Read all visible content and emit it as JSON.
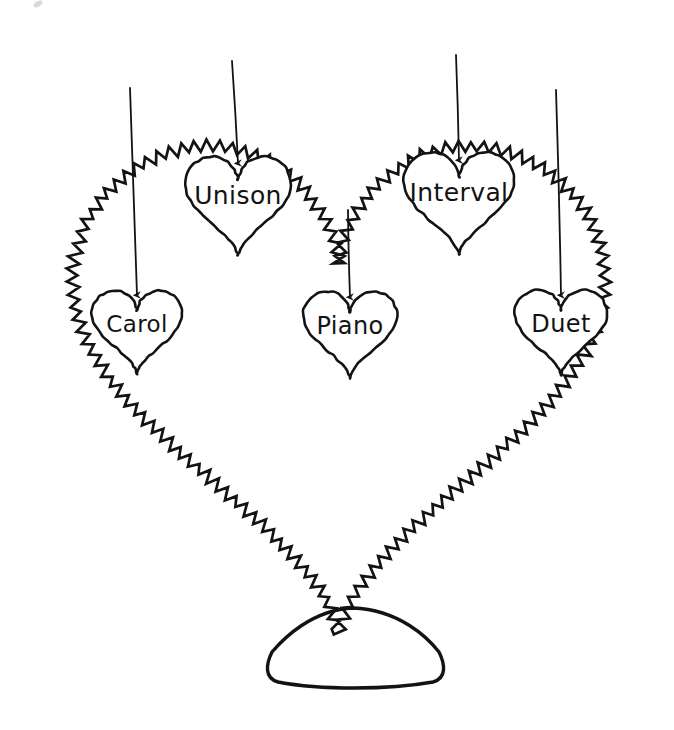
{
  "figure": {
    "type": "hand-drawn-concept-diagram",
    "background_color": "#ffffff",
    "ink_color": "#131313",
    "outer_shape": "heart",
    "outer_shape_stroke_style": "zigzag-sawtooth",
    "base_shape": "rounded-dome-pedestal",
    "arrow_count": 5,
    "inner_shape": "heart"
  },
  "nodes": [
    {
      "id": "carol",
      "label": "Carol",
      "cx": 137,
      "cy": 323,
      "w": 96,
      "h": 98,
      "font_size": 23,
      "arrow": {
        "x1": 130,
        "y1": 88,
        "x2": 137,
        "y2": 295
      }
    },
    {
      "id": "unison",
      "label": "Unison",
      "cx": 238,
      "cy": 195,
      "w": 112,
      "h": 116,
      "font_size": 25,
      "arrow": {
        "x1": 232,
        "y1": 61,
        "x2": 238,
        "y2": 163
      }
    },
    {
      "id": "piano",
      "label": "Piano",
      "cx": 350,
      "cy": 325,
      "w": 100,
      "h": 102,
      "font_size": 24,
      "arrow": {
        "x1": 348,
        "y1": 210,
        "x2": 350,
        "y2": 297
      }
    },
    {
      "id": "interval",
      "label": "Interval",
      "cx": 459,
      "cy": 192,
      "w": 118,
      "h": 120,
      "font_size": 25,
      "arrow": {
        "x1": 456,
        "y1": 55,
        "x2": 459,
        "y2": 160
      }
    },
    {
      "id": "duet",
      "label": "Duet",
      "cx": 561,
      "cy": 323,
      "w": 98,
      "h": 100,
      "font_size": 24,
      "arrow": {
        "x1": 556,
        "y1": 90,
        "x2": 561,
        "y2": 295
      }
    }
  ],
  "outer_heart": {
    "left": 56,
    "right": 622,
    "top": 55,
    "bottom": 617,
    "cleft_x": 348,
    "cleft_y": 210
  },
  "base": {
    "left": 262,
    "right": 448,
    "top": 608,
    "bottom": 688
  }
}
